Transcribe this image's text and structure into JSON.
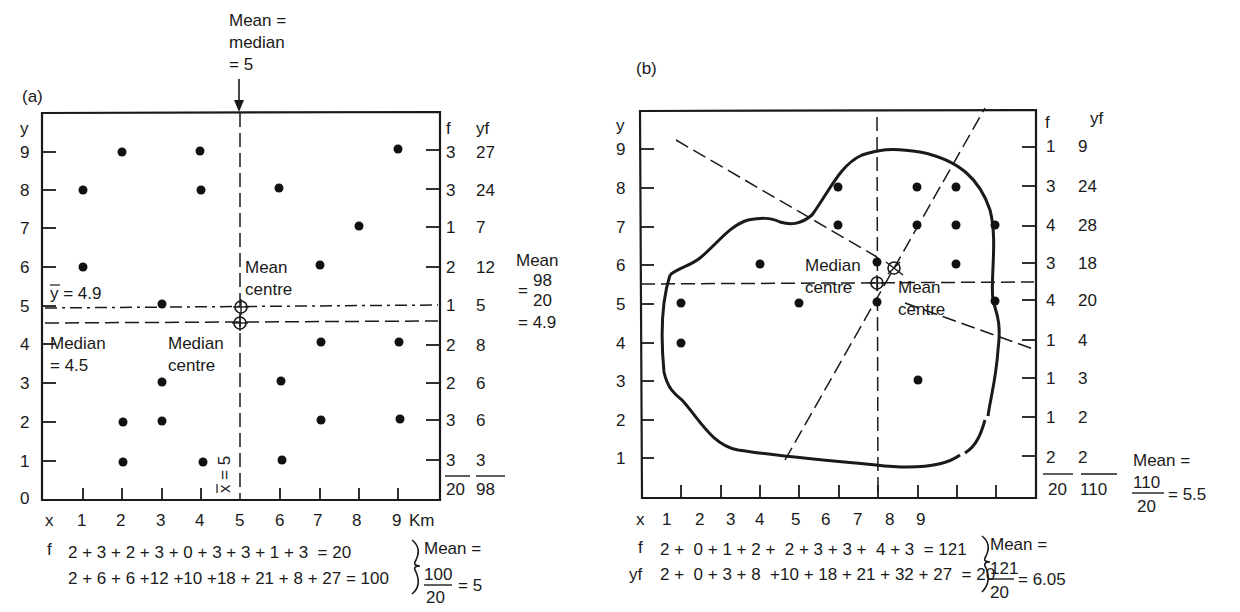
{
  "panel_a": {
    "label": "(a)",
    "top_annotation": [
      "Mean =",
      "median",
      "= 5"
    ],
    "y_axis_label": "y",
    "x_axis_label": "x",
    "x_unit": "Km",
    "y_ticks": [
      "0",
      "1",
      "2",
      "3",
      "4",
      "5",
      "6",
      "7",
      "8",
      "9"
    ],
    "x_ticks": [
      "1",
      "2",
      "3",
      "4",
      "5",
      "6",
      "7",
      "8",
      "9"
    ],
    "right_headers": {
      "f": "f",
      "yf": "yf"
    },
    "right_rows": [
      {
        "y": 9,
        "f": "3",
        "yf": "27"
      },
      {
        "y": 8,
        "f": "3",
        "yf": "24"
      },
      {
        "y": 7,
        "f": "1",
        "yf": "7"
      },
      {
        "y": 6,
        "f": "2",
        "yf": "12"
      },
      {
        "y": 5,
        "f": "1",
        "yf": "5"
      },
      {
        "y": 4,
        "f": "2",
        "yf": "8"
      },
      {
        "y": 3,
        "f": "2",
        "yf": "6"
      },
      {
        "y": 2,
        "f": "3",
        "yf": "6"
      },
      {
        "y": 1,
        "f": "3",
        "yf": "3"
      }
    ],
    "right_totals": {
      "f": "20",
      "yf": "98"
    },
    "y_mean_calc": [
      "Mean",
      "98",
      "20",
      "= 4.9"
    ],
    "ybar_label": "y = 4.9",
    "median_y_label": [
      "Median",
      "= 4.5"
    ],
    "mean_centre_label": [
      "Mean",
      "centre"
    ],
    "median_centre_label": [
      "Median",
      "centre"
    ],
    "xbar_label": "x = 5",
    "points": [
      [
        1,
        8
      ],
      [
        1,
        6
      ],
      [
        2,
        9
      ],
      [
        2,
        2
      ],
      [
        2,
        1
      ],
      [
        3,
        5.1
      ],
      [
        3,
        3
      ],
      [
        3,
        2
      ],
      [
        4,
        9
      ],
      [
        4,
        8
      ],
      [
        4,
        1
      ],
      [
        6,
        8
      ],
      [
        6,
        3
      ],
      [
        6,
        1
      ],
      [
        7,
        6
      ],
      [
        7,
        4
      ],
      [
        7,
        2
      ],
      [
        8,
        7
      ],
      [
        9,
        9
      ],
      [
        9,
        4
      ],
      [
        9,
        2
      ]
    ],
    "mean_centre": [
      5,
      4.9
    ],
    "median_centre": [
      5,
      4.5
    ],
    "f_row_label": "f",
    "f_row": "2 + 3 + 2 + 3 + 0 + 3 + 3 + 1 + 3  = 20",
    "xf_row": "2 + 6 + 6 +12 +10 +18 + 21 + 8 + 27 = 100",
    "x_mean_calc": {
      "head": "Mean =",
      "num": "100",
      "den": "20",
      "result": "= 5"
    }
  },
  "panel_b": {
    "label": "(b)",
    "y_axis_label": "y",
    "x_axis_label": "x",
    "y_ticks": [
      "1",
      "2",
      "3",
      "4",
      "5",
      "6",
      "7",
      "8",
      "9"
    ],
    "x_ticks": [
      "1",
      "2",
      "3",
      "4",
      "5",
      "6",
      "7",
      "8",
      "9"
    ],
    "right_headers": {
      "f": "f",
      "yf": "yf"
    },
    "right_rows": [
      {
        "y": 9,
        "f": "1",
        "yf": "9"
      },
      {
        "y": 8,
        "f": "3",
        "yf": "24"
      },
      {
        "y": 7,
        "f": "4",
        "yf": "28"
      },
      {
        "y": 6,
        "f": "3",
        "yf": "18"
      },
      {
        "y": 5,
        "f": "4",
        "yf": "20"
      },
      {
        "y": 4,
        "f": "1",
        "yf": "4"
      },
      {
        "y": 3,
        "f": "1",
        "yf": "3"
      },
      {
        "y": 2,
        "f": "1",
        "yf": "2"
      },
      {
        "y": 1,
        "f": "2",
        "yf": "2"
      }
    ],
    "right_totals": {
      "f": "20",
      "yf": "110"
    },
    "y_mean_calc": {
      "head": "Mean =",
      "num": "110",
      "den": "20",
      "result": "= 5.5"
    },
    "median_centre_label": [
      "Median",
      "centre"
    ],
    "mean_centre_label": [
      "Mean",
      "centre"
    ],
    "points": [
      [
        1,
        5
      ],
      [
        1,
        4
      ],
      [
        3,
        6
      ],
      [
        4,
        5
      ],
      [
        5,
        8
      ],
      [
        5,
        7
      ],
      [
        6,
        6
      ],
      [
        6,
        5
      ],
      [
        7,
        8
      ],
      [
        7,
        7
      ],
      [
        7,
        3
      ],
      [
        8,
        8
      ],
      [
        8,
        7
      ],
      [
        8,
        6
      ],
      [
        9,
        7
      ],
      [
        9,
        5
      ]
    ],
    "mean_centre": [
      6.05,
      5.5
    ],
    "median_centre": [
      6,
      5.5
    ],
    "f_row_label": "f",
    "yf_row_label": "yf",
    "f_row": "2 +  0 + 1 + 2 +  2 + 3 + 3 +  4 + 3  = 121",
    "xf_row": "2 +  0 + 3 + 8  +10 + 18 + 21 + 32 + 27  = 20",
    "x_mean_calc": {
      "head": "Mean =",
      "num": "121",
      "den": "20",
      "result": "= 6.05"
    }
  }
}
